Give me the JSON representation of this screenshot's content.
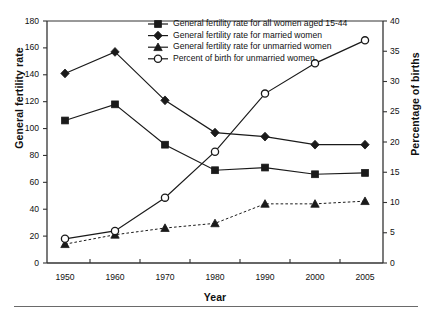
{
  "chart_data": {
    "type": "line",
    "title": "",
    "xlabel": "Year",
    "ylabel": "General fertility rate",
    "ylabel_right": "Percentage of births",
    "categories": [
      "1950",
      "1960",
      "1970",
      "1980",
      "1990",
      "2000",
      "2005"
    ],
    "ylim": [
      0,
      180
    ],
    "yticks": [
      0,
      20,
      40,
      60,
      80,
      100,
      120,
      140,
      160,
      180
    ],
    "ylim_right": [
      0,
      40
    ],
    "yticks_right": [
      0,
      5,
      10,
      15,
      20,
      25,
      30,
      35,
      40
    ],
    "grid": false,
    "legend_position": "top-center",
    "series": [
      {
        "name": "General fertility rate for all women aged 15-44",
        "marker": "filled-square",
        "linestyle": "solid",
        "axis": "left",
        "values": [
          106,
          118,
          88,
          69,
          71,
          66,
          67
        ]
      },
      {
        "name": "General fertility rate for married women",
        "marker": "filled-diamond",
        "linestyle": "solid",
        "axis": "left",
        "values": [
          141,
          157,
          121,
          97,
          94,
          88,
          88
        ]
      },
      {
        "name": "General fertility rate for unmarried women",
        "marker": "filled-triangle",
        "linestyle": "dashed",
        "axis": "left",
        "values": [
          14,
          21,
          26,
          29.5,
          44,
          44,
          46
        ]
      },
      {
        "name": "Percent of birth for unmarried women",
        "marker": "open-circle",
        "linestyle": "solid",
        "axis": "right",
        "values": [
          4.0,
          5.3,
          10.8,
          18.4,
          28.0,
          33.0,
          36.8
        ]
      }
    ]
  },
  "colors": {
    "ink": "#111111",
    "line": "#1a1a1a",
    "axis": "#333333",
    "rule": "#6a6a6a",
    "background": "#ffffff"
  }
}
